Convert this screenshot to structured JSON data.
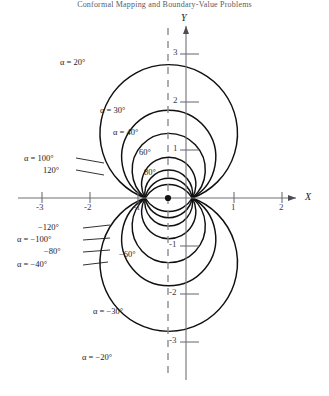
{
  "header": {
    "text": "Conformal Mapping and Boundary-Value Problems"
  },
  "figure": {
    "axes": {
      "x_axis_label": "X",
      "y_axis_label": "Y",
      "x_ticks": [
        "-3",
        "-2",
        "-1",
        "1",
        "2"
      ],
      "y_ticks": [
        "3",
        "2",
        "1",
        "-1",
        "-2",
        "-3"
      ]
    },
    "curve_labels": [
      {
        "id": "a20",
        "text": "α = 20°"
      },
      {
        "id": "a30",
        "text": "α = 30°"
      },
      {
        "id": "a40",
        "text": "α = 40°"
      },
      {
        "id": "a60",
        "text": "60°"
      },
      {
        "id": "a80",
        "text": "80°"
      },
      {
        "id": "a100",
        "text": "α = 100°"
      },
      {
        "id": "a120",
        "text": "120°"
      },
      {
        "id": "am120",
        "text": "−120°"
      },
      {
        "id": "am100",
        "text": "α = −100°"
      },
      {
        "id": "am80",
        "text": "−80°"
      },
      {
        "id": "am60",
        "text": "−60°"
      },
      {
        "id": "am40",
        "text": "α = −40°"
      },
      {
        "id": "am30",
        "text": "α = −30°"
      },
      {
        "id": "am20",
        "text": "α = −20°"
      }
    ]
  },
  "chart_data": {
    "type": "line",
    "title": "",
    "xlabel": "X",
    "ylabel": "Y",
    "xlim": [
      -3.6,
      2.6
    ],
    "ylim": [
      -3.4,
      3.5
    ],
    "grid": false,
    "legend": "inline-labels",
    "poles": [
      {
        "x": -0.85,
        "y": 0
      },
      {
        "x": 0.13,
        "y": 0
      }
    ],
    "marked_point": {
      "x": -0.37,
      "y": 0
    },
    "dashed_vertical_line_x": -0.37,
    "series": [
      {
        "name": "α = 20°",
        "alpha_deg": 20,
        "peak_y": 3.05
      },
      {
        "name": "α = 30°",
        "alpha_deg": 30,
        "peak_y": 2.12
      },
      {
        "name": "α = 40°",
        "alpha_deg": 40,
        "peak_y": 1.6
      },
      {
        "name": "60°",
        "alpha_deg": 60,
        "peak_y": 1.03
      },
      {
        "name": "80°",
        "alpha_deg": 80,
        "peak_y": 0.72
      },
      {
        "name": "α = 100°",
        "alpha_deg": 100,
        "peak_y": 0.5
      },
      {
        "name": "120°",
        "alpha_deg": 120,
        "peak_y": 0.33
      },
      {
        "name": "−120°",
        "alpha_deg": -120,
        "peak_y": -0.33
      },
      {
        "name": "α = −100°",
        "alpha_deg": -100,
        "peak_y": -0.5
      },
      {
        "name": "−80°",
        "alpha_deg": -80,
        "peak_y": -0.72
      },
      {
        "name": "−60°",
        "alpha_deg": -60,
        "peak_y": -1.03
      },
      {
        "name": "α = −40°",
        "alpha_deg": -40,
        "peak_y": -1.6
      },
      {
        "name": "α = −30°",
        "alpha_deg": -30,
        "peak_y": -2.12
      },
      {
        "name": "α = −20°",
        "alpha_deg": -20,
        "peak_y": -3.05
      }
    ]
  }
}
